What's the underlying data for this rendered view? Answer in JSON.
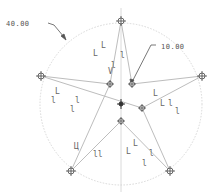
{
  "sketch": {
    "dimensions": [
      {
        "id": "circle-diameter",
        "label": "40.00",
        "x": 6,
        "y": 20
      },
      {
        "id": "inner-offset",
        "label": "10.00",
        "x": 161,
        "y": 43
      }
    ],
    "construction_circle": {
      "cx": 121,
      "cy": 104,
      "r": 81,
      "color": "#d8d8d8"
    },
    "centerlines": {
      "vertical_x": 121,
      "color": "#d0d0d0"
    },
    "star_vertices": [
      {
        "name": "top",
        "x": 121,
        "y": 21
      },
      {
        "name": "left",
        "x": 41,
        "y": 76
      },
      {
        "name": "right",
        "x": 202,
        "y": 76
      },
      {
        "name": "bottom-left",
        "x": 71,
        "y": 171
      },
      {
        "name": "bottom-right",
        "x": 170,
        "y": 171
      }
    ],
    "inner_points": [
      {
        "name": "inner-upper-left",
        "x": 110,
        "y": 84
      },
      {
        "name": "inner-upper-right",
        "x": 132,
        "y": 84
      },
      {
        "name": "inner-right",
        "x": 142,
        "y": 108
      },
      {
        "name": "inner-bottom",
        "x": 121,
        "y": 121
      },
      {
        "name": "center",
        "x": 121,
        "y": 104
      }
    ],
    "line_color": "#bdbdbd",
    "constraint_glyphs": [
      {
        "text": "L",
        "x": 101,
        "y": 42
      },
      {
        "text": "L",
        "x": 93,
        "y": 50
      },
      {
        "text": "l",
        "x": 120,
        "y": 52
      },
      {
        "text": "l",
        "x": 111,
        "y": 62
      },
      {
        "text": "V",
        "x": 108,
        "y": 68
      },
      {
        "text": "L",
        "x": 55,
        "y": 88
      },
      {
        "text": "l",
        "x": 51,
        "y": 97
      },
      {
        "text": "l",
        "x": 75,
        "y": 97
      },
      {
        "text": "l",
        "x": 70,
        "y": 106
      },
      {
        "text": "L",
        "x": 153,
        "y": 90
      },
      {
        "text": "L",
        "x": 160,
        "y": 100
      },
      {
        "text": "l",
        "x": 168,
        "y": 100
      },
      {
        "text": "l",
        "x": 175,
        "y": 108
      },
      {
        "text": "Ц",
        "x": 74,
        "y": 143
      },
      {
        "text": "ll",
        "x": 93,
        "y": 151
      },
      {
        "text": "L",
        "x": 126,
        "y": 148
      },
      {
        "text": "L",
        "x": 133,
        "y": 140
      },
      {
        "text": "l",
        "x": 149,
        "y": 150
      },
      {
        "text": "l",
        "x": 142,
        "y": 160
      }
    ]
  }
}
